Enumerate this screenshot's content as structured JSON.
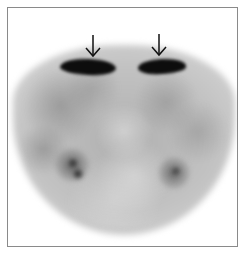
{
  "image": {
    "type": "grayscale nuclear medicine axial scan",
    "annotations": {
      "arrows": [
        {
          "id": "arrow-left",
          "direction": "down",
          "target": "left-intense-uptake"
        },
        {
          "id": "arrow-right",
          "direction": "down",
          "target": "right-intense-uptake"
        }
      ]
    },
    "colors": {
      "background": "#ffffff",
      "frame_border": "#8a8a8a",
      "intense_uptake": "#0d0d0d",
      "arrow": "#111111"
    }
  }
}
